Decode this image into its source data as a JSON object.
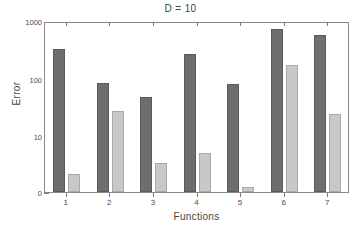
{
  "chart_data": {
    "type": "bar",
    "title": "D = 10",
    "xlabel": "Functions",
    "ylabel": "Error",
    "categories": [
      "1",
      "2",
      "3",
      "4",
      "5",
      "6",
      "7"
    ],
    "yscale": "log",
    "ylim": [
      0,
      1000
    ],
    "ytick_labels": [
      "1000",
      "100",
      "10",
      "0"
    ],
    "ytick_values": [
      1000,
      100,
      10,
      0
    ],
    "grid": false,
    "legend": "none",
    "series": [
      {
        "name": "series-dark",
        "color": "#6e6e6e",
        "values": [
          330,
          85,
          48,
          270,
          80,
          730,
          560
        ]
      },
      {
        "name": "series-light",
        "color": "#c8c8c8",
        "values": [
          2.2,
          27,
          3.4,
          5.0,
          1.3,
          170,
          24
        ]
      }
    ]
  },
  "axis": {
    "frame_color": "#8a8a8a",
    "text_color": "#444444"
  }
}
